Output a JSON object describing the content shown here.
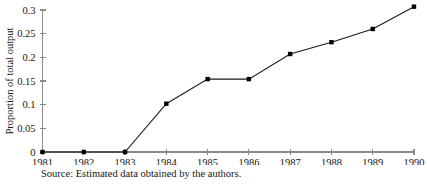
{
  "chart_data": {
    "type": "line",
    "title": "",
    "xlabel": "",
    "ylabel": "Proportion of total output",
    "categories": [
      "1981",
      "1982",
      "1983",
      "1984",
      "1985",
      "1986",
      "1987",
      "1988",
      "1989",
      "1990"
    ],
    "x": [
      1981,
      1982,
      1983,
      1984,
      1985,
      1986,
      1987,
      1988,
      1989,
      1990
    ],
    "values": [
      0,
      0,
      0,
      0.102,
      0.154,
      0.154,
      0.207,
      0.232,
      0.26,
      0.307
    ],
    "series": [
      {
        "name": "Proportion of total output",
        "values": [
          0,
          0,
          0,
          0.102,
          0.154,
          0.154,
          0.207,
          0.232,
          0.26,
          0.307
        ]
      }
    ],
    "ylim": [
      0,
      0.3
    ],
    "xlim": [
      1981,
      1990
    ],
    "yticks": [
      0,
      0.05,
      0.1,
      0.15,
      0.2,
      0.25,
      0.3
    ],
    "ytick_labels": [
      "0",
      "0.05",
      "0.1",
      "0.15",
      "0.2",
      "0.25",
      "0.3"
    ],
    "xticks": [
      1981,
      1982,
      1983,
      1984,
      1985,
      1986,
      1987,
      1988,
      1989,
      1990
    ],
    "xtick_labels": [
      "1981",
      "1982",
      "1983",
      "1984",
      "1985",
      "1986",
      "1987",
      "1988",
      "1989",
      "1990"
    ],
    "grid": false,
    "legend": false,
    "legend_position": "none",
    "marker": "square",
    "line_color": "#1a1a1a",
    "marker_color": "#000000",
    "axis_color": "#8a8a8a",
    "background_color": "#ffffff"
  },
  "source_note": "Source: Estimated data obtained by the authors."
}
